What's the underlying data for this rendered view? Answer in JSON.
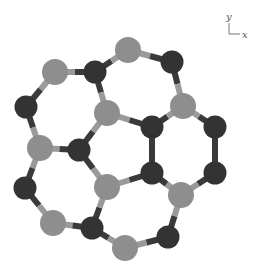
{
  "diagram": {
    "type": "molecular-structure",
    "axes": {
      "y_label": "y",
      "x_label": "x"
    },
    "colors": {
      "light_atom": "#8e8e8e",
      "dark_atom": "#333333",
      "bond_light": "#9a9a9a",
      "bond_dark": "#3a3a3a"
    },
    "atoms": [
      {
        "id": 0,
        "x": 128,
        "y": 50,
        "type": "light"
      },
      {
        "id": 1,
        "x": 55,
        "y": 72,
        "type": "light"
      },
      {
        "id": 2,
        "x": 95,
        "y": 72,
        "type": "dark"
      },
      {
        "id": 3,
        "x": 172,
        "y": 62,
        "type": "dark"
      },
      {
        "id": 4,
        "x": 26,
        "y": 107,
        "type": "dark"
      },
      {
        "id": 5,
        "x": 107,
        "y": 113,
        "type": "light"
      },
      {
        "id": 6,
        "x": 183,
        "y": 106,
        "type": "light"
      },
      {
        "id": 7,
        "x": 152,
        "y": 127,
        "type": "dark"
      },
      {
        "id": 8,
        "x": 215,
        "y": 127,
        "type": "dark"
      },
      {
        "id": 9,
        "x": 40,
        "y": 148,
        "type": "light"
      },
      {
        "id": 10,
        "x": 79,
        "y": 150,
        "type": "dark"
      },
      {
        "id": 11,
        "x": 152,
        "y": 173,
        "type": "dark"
      },
      {
        "id": 12,
        "x": 215,
        "y": 173,
        "type": "dark"
      },
      {
        "id": 13,
        "x": 25,
        "y": 188,
        "type": "dark"
      },
      {
        "id": 14,
        "x": 107,
        "y": 187,
        "type": "light"
      },
      {
        "id": 15,
        "x": 181,
        "y": 195,
        "type": "light"
      },
      {
        "id": 16,
        "x": 53,
        "y": 223,
        "type": "light"
      },
      {
        "id": 17,
        "x": 92,
        "y": 228,
        "type": "dark"
      },
      {
        "id": 18,
        "x": 168,
        "y": 237,
        "type": "dark"
      },
      {
        "id": 19,
        "x": 125,
        "y": 248,
        "type": "light"
      }
    ],
    "bonds": [
      [
        1,
        2
      ],
      [
        2,
        0
      ],
      [
        0,
        3
      ],
      [
        3,
        6
      ],
      [
        2,
        5
      ],
      [
        1,
        4
      ],
      [
        4,
        9
      ],
      [
        9,
        10
      ],
      [
        10,
        5
      ],
      [
        5,
        7
      ],
      [
        7,
        6
      ],
      [
        6,
        8
      ],
      [
        8,
        12
      ],
      [
        12,
        15
      ],
      [
        15,
        11
      ],
      [
        11,
        7
      ],
      [
        10,
        14
      ],
      [
        14,
        11
      ],
      [
        9,
        13
      ],
      [
        13,
        16
      ],
      [
        16,
        17
      ],
      [
        17,
        14
      ],
      [
        17,
        19
      ],
      [
        19,
        18
      ],
      [
        18,
        15
      ]
    ]
  }
}
